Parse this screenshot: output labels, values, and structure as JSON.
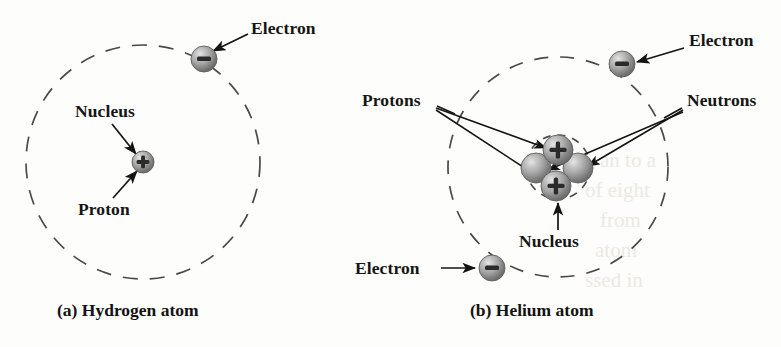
{
  "figure": {
    "background_color": "#fdfdfb",
    "ink_color": "#1a1a1a",
    "sphere_color": "#9a9a9a",
    "orbit_style": "dashed"
  },
  "panel_a": {
    "caption": "(a) Hydrogen atom",
    "orbit": {
      "cx": 143,
      "cy": 162,
      "r": 117
    },
    "labels": {
      "electron": "Electron",
      "nucleus": "Nucleus",
      "proton": "Proton"
    },
    "particles": [
      {
        "name": "electron",
        "charge": "−",
        "cx": 204,
        "cy": 59,
        "r": 13
      },
      {
        "name": "proton",
        "charge": "+",
        "cx": 143,
        "cy": 162,
        "r": 11
      }
    ]
  },
  "panel_b": {
    "caption": "(b) Helium atom",
    "orbit": {
      "cx": 558,
      "cy": 167,
      "r": 110
    },
    "nucleus_ring": {
      "cx": 558,
      "cy": 167,
      "r": 32
    },
    "labels": {
      "electron_top": "Electron",
      "electron_bottom": "Electron",
      "protons": "Protons",
      "neutrons": "Neutrons",
      "nucleus": "Nucleus"
    },
    "particles": [
      {
        "name": "electron-top-right",
        "charge": "−",
        "cx": 622,
        "cy": 64,
        "r": 13
      },
      {
        "name": "electron-bottom-left",
        "charge": "−",
        "cx": 492,
        "cy": 268,
        "r": 13
      },
      {
        "name": "proton-top",
        "charge": "+",
        "cx": 558,
        "cy": 150,
        "r": 15
      },
      {
        "name": "proton-bottom",
        "charge": "+",
        "cx": 556,
        "cy": 186,
        "r": 15
      },
      {
        "name": "neutron-left",
        "charge": "",
        "cx": 536,
        "cy": 168,
        "r": 15
      },
      {
        "name": "neutron-right",
        "charge": "",
        "cx": 578,
        "cy": 168,
        "r": 15
      }
    ]
  },
  "watermark": {
    "lines": [
      "an to a",
      "of eight",
      "from",
      "atom",
      "ssed in"
    ]
  }
}
